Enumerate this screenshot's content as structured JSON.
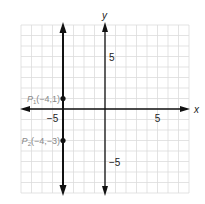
{
  "chart_data": {
    "type": "line",
    "title": "",
    "xlabel": "x",
    "ylabel": "y",
    "xlim": [
      -8,
      8
    ],
    "ylim": [
      -8,
      8
    ],
    "grid": true,
    "x_ticks": [
      {
        "value": -5,
        "label": "−5"
      },
      {
        "value": 5,
        "label": "5"
      }
    ],
    "y_ticks": [
      {
        "value": 5,
        "label": "5"
      },
      {
        "value": -5,
        "label": "−5"
      }
    ],
    "series": [
      {
        "name": "vertical line x = -4",
        "x": [
          -4,
          -4
        ],
        "y": [
          -8,
          8
        ],
        "arrows": true
      }
    ],
    "points": [
      {
        "name": "P1",
        "label_main": "P",
        "label_sub": "1",
        "label_coords": "(−4,1)",
        "x": -4,
        "y": 1
      },
      {
        "name": "P2",
        "label_main": "P",
        "label_sub": "2",
        "label_coords": "(−4,−3)",
        "x": -4,
        "y": -3
      }
    ]
  },
  "colors": {
    "grid": "#dcdcdc",
    "axis": "#111111",
    "line": "#111111",
    "label": "#888888",
    "tick": "#222222"
  }
}
